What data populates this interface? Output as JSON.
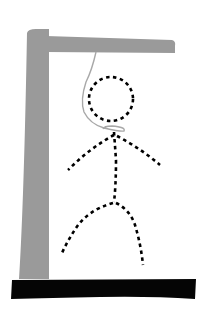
{
  "game": {
    "type": "hangman",
    "gallows": {
      "post_color": "#9a9a9a",
      "beam_color": "#9a9a9a",
      "base_color": "#050505",
      "rope_color": "#a8a8a8"
    },
    "figure": {
      "style": "dashed",
      "stroke_color": "#000000",
      "parts_visible": [
        "head",
        "body",
        "left-arm",
        "right-arm",
        "left-leg",
        "right-leg"
      ]
    }
  }
}
